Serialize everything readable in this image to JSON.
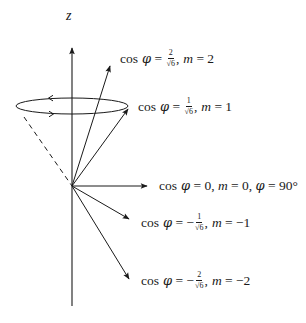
{
  "diagram": {
    "axis": {
      "label": "z",
      "origin": [
        72,
        186
      ],
      "top": [
        72,
        46
      ],
      "bottom": [
        72,
        306
      ]
    },
    "colors": {
      "stroke": "#1a1a1a",
      "background": "#ffffff"
    },
    "precession_cone": {
      "ellipse_center": [
        72,
        106
      ],
      "rx": 56,
      "ry": 8,
      "dashed_edge_from": [
        24,
        117
      ],
      "direction_arrows": [
        "left-on-top",
        "right-on-bottom"
      ]
    },
    "vectors": [
      {
        "m": 2,
        "tip": [
          110,
          66
        ],
        "label": {
          "prefix": "cos ",
          "phi": "φ",
          "eq": " = ",
          "sign": "",
          "num": "2",
          "den": "√6",
          "rest_m": "m",
          "rest": " = 2",
          "extra": ""
        }
      },
      {
        "m": 1,
        "tip": [
          128,
          109
        ],
        "label": {
          "prefix": "cos ",
          "phi": "φ",
          "eq": " = ",
          "sign": "",
          "num": "1",
          "den": "√6",
          "rest_m": "m",
          "rest": " = 1",
          "extra": ""
        }
      },
      {
        "m": 0,
        "tip": [
          147,
          186
        ],
        "label": {
          "prefix": "cos ",
          "phi": "φ",
          "eq": " = 0, ",
          "rest_m": "m",
          "rest": " = 0, ",
          "phi2": "φ",
          "extra": " = 90°"
        }
      },
      {
        "m": -1,
        "tip": [
          129,
          219
        ],
        "label": {
          "prefix": "cos ",
          "phi": "φ",
          "eq": " = ",
          "sign": "−",
          "num": "1",
          "den": "√6",
          "rest_m": "m",
          "rest": " = −1",
          "extra": ""
        }
      },
      {
        "m": -2,
        "tip": [
          129,
          279
        ],
        "label": {
          "prefix": "cos ",
          "phi": "φ",
          "eq": " = ",
          "sign": "−",
          "num": "2",
          "den": "√6",
          "rest_m": "m",
          "rest": " = −2",
          "extra": ""
        }
      }
    ]
  }
}
